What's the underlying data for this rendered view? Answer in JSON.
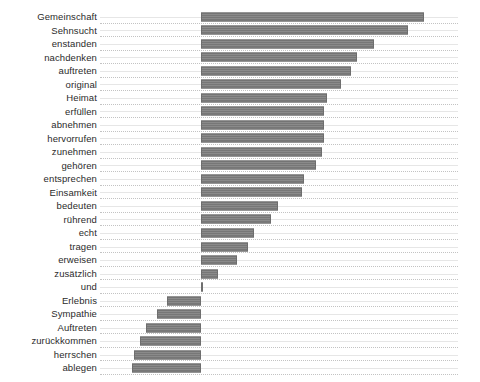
{
  "chart_data": {
    "type": "bar",
    "orientation": "horizontal",
    "title": "",
    "subtitle": "",
    "xlabel": "",
    "ylabel": "",
    "grid": true,
    "gridlines": "dotted horizontal separators between categories",
    "legend": null,
    "legend_position": "none",
    "xlim": [
      -110,
      270
    ],
    "zero_baseline_px": 201,
    "bar_color": "#7d7d7d",
    "background_color": "#ffffff",
    "axis_tick_labels": [],
    "categories": [
      "Gemeinschaft",
      "Sehnsucht",
      "enstanden",
      "nachdenken",
      "auftreten",
      "original",
      "Heimat",
      "erfüllen",
      "abnehmen",
      "hervorrufen",
      "zunehmen",
      "gehören",
      "entsprechen",
      "Einsamkeit",
      "bedeuten",
      "rührend",
      "echt",
      "tragen",
      "erweisen",
      "zusätzlich",
      "und",
      "Erlebnis",
      "Sympathie",
      "Auftreten",
      "zurückkommen",
      "herrschen",
      "ablegen"
    ],
    "values": [
      237,
      220,
      184,
      166,
      159,
      149,
      134,
      131,
      131,
      131,
      128,
      122,
      109,
      107,
      82,
      74,
      56,
      50,
      38,
      18,
      2,
      -36,
      -47,
      -58,
      -65,
      -71,
      -73
    ]
  }
}
